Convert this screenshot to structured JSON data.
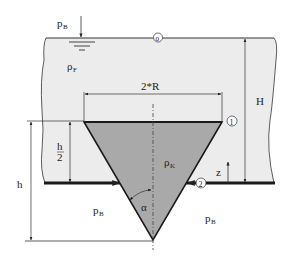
{
  "diagram": {
    "colors": {
      "fluid": "#ececec",
      "body": "#a9a9a9",
      "line": "#222222",
      "background": "#ffffff"
    },
    "labels": {
      "pressure_top": "p",
      "pressure_top_sub": "B",
      "fluid_density": "ρ",
      "fluid_density_sub": "F",
      "body_density": "ρ",
      "body_density_sub": "K",
      "width_dim": "2*R",
      "height_total": "H",
      "height_cone": "h",
      "half_height_num": "h",
      "half_height_den": "2",
      "z_axis": "z",
      "angle": "α",
      "pressure_bottom_left": "p",
      "pressure_bottom_left_sub": "B",
      "pressure_bottom_right": "p",
      "pressure_bottom_right_sub": "B",
      "point_0": "0",
      "point_1": "1",
      "point_2": "2"
    }
  }
}
